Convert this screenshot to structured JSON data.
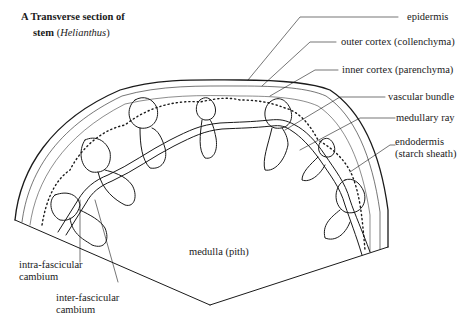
{
  "title": {
    "line1": "A Transverse section of",
    "line2_prefix": "stem",
    "line2_paren_open": "(",
    "line2_species": "Helianthus",
    "line2_paren_close": ")"
  },
  "labels": {
    "epidermis": "epidermis",
    "outer_cortex": "outer cortex (collenchyma)",
    "inner_cortex": "inner cortex (parenchyma)",
    "vascular_bundle": "vascular bundle",
    "medullary_ray": "medullary ray",
    "endodermis_line1": "endodermis",
    "endodermis_line2": "(starch sheath)",
    "medulla": "medulla (pith)",
    "intra_line1": "intra-fascicular",
    "intra_line2": "cambium",
    "inter_line1": "inter-fascicular",
    "inter_line2": "cambium"
  },
  "colors": {
    "ink": "#1a1a1a",
    "background": "#ffffff"
  }
}
